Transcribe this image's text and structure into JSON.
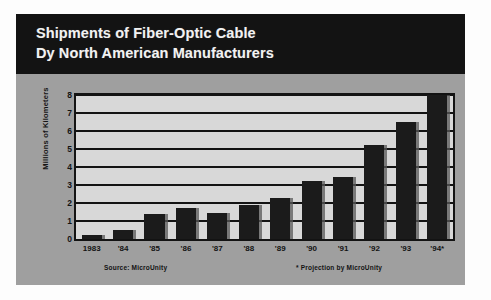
{
  "title": {
    "line1": "Shipments of Fiber-Optic Cable",
    "line2": "Dy North American Manufacturers"
  },
  "footnotes": {
    "source": "Source: MicroUnity",
    "projection": "* Projection by MicroUnity"
  },
  "colors": {
    "title_background": "#131313",
    "title_text": "#f2f2f2",
    "panel_background": "#9f9f9f",
    "plot_background": "#d8d8d8",
    "bar": "#1b1b1b",
    "axis": "#131313"
  },
  "chart_data": {
    "type": "bar",
    "title": "Shipments of Fiber-Optic Cable Dy North American Manufacturers",
    "xlabel": "",
    "ylabel": "Millions of Kilometers",
    "categories": [
      "1983",
      "'84",
      "'85",
      "'86",
      "'87",
      "'88",
      "'89",
      "'90",
      "'91",
      "'92",
      "'93",
      "'94*"
    ],
    "values": [
      0.25,
      0.5,
      1.4,
      1.7,
      1.45,
      1.9,
      2.3,
      3.2,
      3.45,
      5.25,
      6.5,
      8.0
    ],
    "ylim": [
      0,
      8
    ],
    "yticks": [
      0,
      1,
      2,
      3,
      4,
      5,
      6,
      7,
      8
    ],
    "ytick_labels": [
      "0",
      "1",
      "2",
      "3",
      "4",
      "5",
      "6",
      "7",
      "8"
    ],
    "grid": true,
    "legend": false,
    "annotations": [
      "Source: MicroUnity",
      "* Projection by MicroUnity"
    ]
  }
}
